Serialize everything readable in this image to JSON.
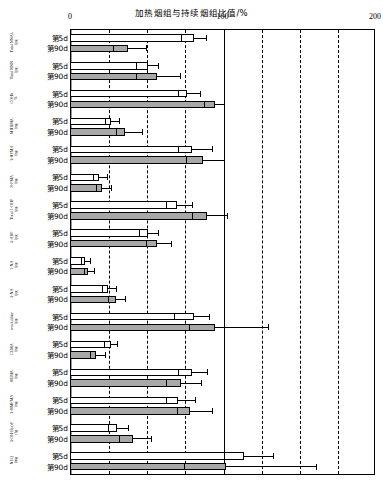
{
  "chart_data": {
    "type": "bar",
    "orientation": "horizontal",
    "title": "加热烟组与持续烟组比值/%",
    "xlabel": "加热烟组与持续烟组比值/%",
    "ylabel": "",
    "xlim": [
      0,
      200
    ],
    "xticks": [
      0,
      100,
      200
    ],
    "xtick_labels": [
      "0",
      "100",
      "200"
    ],
    "gridlines_minor": [
      25,
      50,
      75,
      125,
      150,
      175
    ],
    "gridline_major_solid": [
      100
    ],
    "grid": true,
    "legend": null,
    "series": [
      {
        "name": "第5d",
        "fill": "#ffffff"
      },
      {
        "name": "第90d",
        "fill": "#a8a8a8"
      }
    ],
    "categories": [
      "Total NNAL/ (pg/mg 肌酐)",
      "Total NNN/ (pg/mg 肌酐)",
      "COHb/ %",
      "MHBMA/ (ng/mg 肌酐)",
      "3-HPMA/ (ng/mg 肌酐)",
      "S-PMA/ (ng/mg 肌酐)",
      "Total 1-OHP/ (pg/mg 肌酐)",
      "4-ABP/ (pg/mg 肌酐)",
      "1-NA/ (pg/mg 肌酐)",
      "2-NA/ (pg/mg 肌酐)",
      "o-toluidine/ (pg/mg 肌酐)",
      "CEMA/ (ng/mg 肌酐)",
      "HEMA/ (ng/mg 肌酐)",
      "3-HMPMA/ (ng/mg 肌酐)",
      "3-OH-B(a)P/ (fg/mg 肌酐)",
      "NEQ/ (mg/d 肌酐)"
    ],
    "rows": [
      {
        "category": "Total NNAL/ (pg/mg 肌酐)",
        "day": "第5d",
        "value": 81,
        "inner": 73,
        "err_low": 73,
        "err_high": 89
      },
      {
        "category": "Total NNAL/ (pg/mg 肌酐)",
        "day": "第90d",
        "value": 38,
        "inner": 28,
        "err_low": 28,
        "err_high": 50
      },
      {
        "category": "Total NNN/ (pg/mg 肌酐)",
        "day": "第5d",
        "value": 51,
        "inner": 43,
        "err_low": 43,
        "err_high": 58
      },
      {
        "category": "Total NNN/ (pg/mg 肌酐)",
        "day": "第90d",
        "value": 57,
        "inner": 43,
        "err_low": 43,
        "err_high": 72
      },
      {
        "category": "COHb/ %",
        "day": "第5d",
        "value": 77,
        "inner": 71,
        "err_low": 71,
        "err_high": 85
      },
      {
        "category": "COHb/ %",
        "day": "第90d",
        "value": 95,
        "inner": 88,
        "err_low": 88,
        "err_high": 101
      },
      {
        "category": "MHBMA/ (ng/mg 肌酐)",
        "day": "第5d",
        "value": 27,
        "inner": 23,
        "err_low": 23,
        "err_high": 32
      },
      {
        "category": "MHBMA/ (ng/mg 肌酐)",
        "day": "第90d",
        "value": 36,
        "inner": 30,
        "err_low": 30,
        "err_high": 47
      },
      {
        "category": "3-HPMA/ (ng/mg 肌酐)",
        "day": "第5d",
        "value": 80,
        "inner": 71,
        "err_low": 71,
        "err_high": 93
      },
      {
        "category": "3-HPMA/ (ng/mg 肌酐)",
        "day": "第90d",
        "value": 87,
        "inner": 76,
        "err_low": 76,
        "err_high": 101
      },
      {
        "category": "S-PMA/ (ng/mg 肌酐)",
        "day": "第5d",
        "value": 19,
        "inner": 15,
        "err_low": 15,
        "err_high": 24
      },
      {
        "category": "S-PMA/ (ng/mg 肌酐)",
        "day": "第90d",
        "value": 21,
        "inner": 17,
        "err_low": 17,
        "err_high": 27
      },
      {
        "category": "Total 1-OHP/ (pg/mg 肌酐)",
        "day": "第5d",
        "value": 70,
        "inner": 63,
        "err_low": 63,
        "err_high": 80
      },
      {
        "category": "Total 1-OHP/ (pg/mg 肌酐)",
        "day": "第90d",
        "value": 90,
        "inner": 80,
        "err_low": 80,
        "err_high": 103
      },
      {
        "category": "4-ABP/ (pg/mg 肌酐)",
        "day": "第5d",
        "value": 51,
        "inner": 45,
        "err_low": 45,
        "err_high": 58
      },
      {
        "category": "4-ABP/ (pg/mg 肌酐)",
        "day": "第90d",
        "value": 57,
        "inner": 50,
        "err_low": 50,
        "err_high": 66
      },
      {
        "category": "1-NA/ (pg/mg 肌酐)",
        "day": "第5d",
        "value": 10,
        "inner": 7,
        "err_low": 7,
        "err_high": 13
      },
      {
        "category": "1-NA/ (pg/mg 肌酐)",
        "day": "第90d",
        "value": 12,
        "inner": 9,
        "err_low": 9,
        "err_high": 16
      },
      {
        "category": "2-NA/ (pg/mg 肌酐)",
        "day": "第5d",
        "value": 25,
        "inner": 21,
        "err_low": 21,
        "err_high": 30
      },
      {
        "category": "2-NA/ (pg/mg 肌酐)",
        "day": "第90d",
        "value": 30,
        "inner": 25,
        "err_low": 25,
        "err_high": 36
      },
      {
        "category": "o-toluidine/ (pg/mg 肌酐)",
        "day": "第5d",
        "value": 81,
        "inner": 68,
        "err_low": 68,
        "err_high": 91
      },
      {
        "category": "o-toluidine/ (pg/mg 肌酐)",
        "day": "第90d",
        "value": 95,
        "inner": 78,
        "err_low": 78,
        "err_high": 130
      },
      {
        "category": "CEMA/ (ng/mg 肌酐)",
        "day": "第5d",
        "value": 27,
        "inner": 22,
        "err_low": 22,
        "err_high": 31
      },
      {
        "category": "CEMA/ (ng/mg 肌酐)",
        "day": "第90d",
        "value": 17,
        "inner": 13,
        "err_low": 13,
        "err_high": 23
      },
      {
        "category": "HEMA/ (ng/mg 肌酐)",
        "day": "第5d",
        "value": 80,
        "inner": 71,
        "err_low": 71,
        "err_high": 90
      },
      {
        "category": "HEMA/ (ng/mg 肌酐)",
        "day": "第90d",
        "value": 73,
        "inner": 63,
        "err_low": 63,
        "err_high": 86
      },
      {
        "category": "3-HMPMA/ (ng/mg 肌酐)",
        "day": "第5d",
        "value": 71,
        "inner": 63,
        "err_low": 63,
        "err_high": 82
      },
      {
        "category": "3-HMPMA/ (ng/mg 肌酐)",
        "day": "第90d",
        "value": 79,
        "inner": 70,
        "err_low": 70,
        "err_high": 93
      },
      {
        "category": "3-OH-B(a)P/ (fg/mg 肌酐)",
        "day": "第5d",
        "value": 31,
        "inner": 25,
        "err_low": 25,
        "err_high": 38
      },
      {
        "category": "3-OH-B(a)P/ (fg/mg 肌酐)",
        "day": "第90d",
        "value": 41,
        "inner": 32,
        "err_low": 32,
        "err_high": 53
      },
      {
        "category": "NEQ/ (mg/d 肌酐)",
        "day": "第5d",
        "value": 114,
        "inner": 101,
        "err_low": 101,
        "err_high": 133
      },
      {
        "category": "NEQ/ (mg/d 肌酐)",
        "day": "第90d",
        "value": 102,
        "inner": 75,
        "err_low": 75,
        "err_high": 161
      }
    ]
  }
}
